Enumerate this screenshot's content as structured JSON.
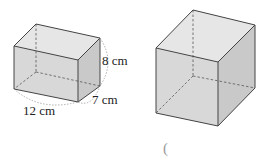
{
  "figure": {
    "left_shape": {
      "type": "rectangular-prism",
      "dimensions": {
        "height": "8 cm",
        "depth": "7 cm",
        "width": "12 cm"
      }
    },
    "right_shape": {
      "type": "cube"
    },
    "answer_blank": "(",
    "colors": {
      "face_front": "#d9d9d9",
      "face_side": "#c8c8c8",
      "face_top": "#e8e8e8",
      "edge": "#444444",
      "hidden_edge": "#555555",
      "brace": "#9a9a9a"
    }
  }
}
